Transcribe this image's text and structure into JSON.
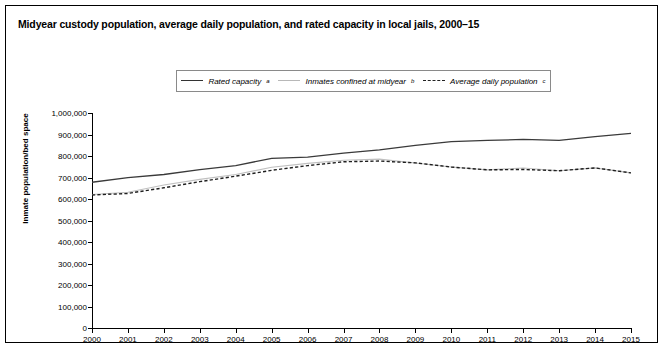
{
  "figure": {
    "title": "Midyear custody population, average daily population, and rated capacity in local jails, 2000–15"
  },
  "legend": {
    "entries": [
      {
        "label": "Rated capacity",
        "note": "a",
        "style": "solid-dark"
      },
      {
        "label": "Inmates confined at midyear",
        "note": "b",
        "style": "solid-light"
      },
      {
        "label": "Average daily population",
        "note": "c",
        "style": "dashed"
      }
    ]
  },
  "axes": {
    "ylabel": "Inmate population/bed space",
    "yticks": [
      "1,000,000",
      "900,000",
      "800,000",
      "700,000",
      "600,000",
      "500,000",
      "400,000",
      "300,000",
      "200,000",
      "100,000",
      "0"
    ],
    "xticks": [
      "2000",
      "2001",
      "2002",
      "2003",
      "2004",
      "2005",
      "2006",
      "2007",
      "2008",
      "2009",
      "2010",
      "2011",
      "2012",
      "2013",
      "2014",
      "2015"
    ]
  },
  "chart_data": {
    "type": "line",
    "title": "Midyear custody population, average daily population, and rated capacity in local jails, 2000–15",
    "xlabel": "",
    "ylabel": "Inmate population/bed space",
    "ylim": [
      0,
      1000000
    ],
    "xlim": [
      2000,
      2015
    ],
    "grid": false,
    "legend_position": "top-center",
    "x": [
      2000,
      2001,
      2002,
      2003,
      2004,
      2005,
      2006,
      2007,
      2008,
      2009,
      2010,
      2011,
      2012,
      2013,
      2014,
      2015
    ],
    "series": [
      {
        "name": "Rated capacity",
        "note": "a",
        "style": "solid-dark",
        "values": [
          677787,
          699309,
          713899,
          736471,
          755603,
          789001,
          795221,
          813502,
          828714,
          849544,
          866782,
          872450,
          877185,
          872369,
          890489,
          904890
        ]
      },
      {
        "name": "Inmates confined at midyear",
        "note": "b",
        "style": "solid-light",
        "values": [
          621149,
          631240,
          665475,
          691301,
          713990,
          747529,
          765819,
          780174,
          785533,
          767434,
          748728,
          735565,
          744524,
          731208,
          744592,
          721300
        ]
      },
      {
        "name": "Average daily population",
        "note": "c",
        "style": "dashed",
        "values": [
          618319,
          625966,
          652082,
          680760,
          706242,
          733442,
          755320,
          773138,
          776573,
          767992,
          748553,
          735601,
          737369,
          731352,
          744600,
          721300
        ]
      }
    ]
  }
}
